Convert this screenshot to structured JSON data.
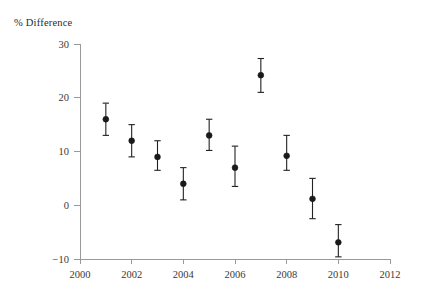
{
  "chart_data": {
    "type": "scatter",
    "title": "",
    "subtitle": "",
    "ylabel": "% Difference",
    "xlabel": "",
    "x": [
      2001,
      2002,
      2003,
      2004,
      2005,
      2006,
      2007,
      2008,
      2009,
      2010
    ],
    "values": [
      16.0,
      12.0,
      9.0,
      4.0,
      13.0,
      7.0,
      24.2,
      9.2,
      1.2,
      -6.9
    ],
    "error_low": [
      13.0,
      9.0,
      6.5,
      1.0,
      10.2,
      3.5,
      21.0,
      6.5,
      -2.5,
      -9.6
    ],
    "error_high": [
      19.0,
      15.0,
      12.0,
      7.0,
      16.0,
      11.0,
      27.3,
      13.0,
      5.0,
      -3.6
    ],
    "series": [
      {
        "name": "% Difference",
        "points": [
          {
            "x": 2001,
            "y": 16.0,
            "low": 13.0,
            "high": 19.0
          },
          {
            "x": 2002,
            "y": 12.0,
            "low": 9.0,
            "high": 15.0
          },
          {
            "x": 2003,
            "y": 9.0,
            "low": 6.5,
            "high": 12.0
          },
          {
            "x": 2004,
            "y": 4.0,
            "low": 1.0,
            "high": 7.0
          },
          {
            "x": 2005,
            "y": 13.0,
            "low": 10.2,
            "high": 16.0
          },
          {
            "x": 2006,
            "y": 7.0,
            "low": 3.5,
            "high": 11.0
          },
          {
            "x": 2007,
            "y": 24.2,
            "low": 21.0,
            "high": 27.3
          },
          {
            "x": 2008,
            "y": 9.2,
            "low": 6.5,
            "high": 13.0
          },
          {
            "x": 2009,
            "y": 1.2,
            "low": -2.5,
            "high": 5.0
          },
          {
            "x": 2010,
            "y": -6.9,
            "low": -9.6,
            "high": -3.6
          }
        ]
      }
    ],
    "xlim": [
      2000,
      2012
    ],
    "ylim": [
      -10,
      30
    ],
    "xticks": [
      2000,
      2002,
      2004,
      2006,
      2008,
      2010,
      2012
    ],
    "xtick_labels": [
      "2000",
      "2002",
      "2004",
      "2006",
      "2008",
      "2010",
      "2012"
    ],
    "yticks": [
      -10,
      0,
      10,
      20,
      30
    ],
    "ytick_labels": [
      "−10",
      "0",
      "10",
      "20",
      "30"
    ],
    "grid": false,
    "legend": "none",
    "marker_color": "#1a1a1a",
    "axis_color": "#9a9a9a"
  }
}
